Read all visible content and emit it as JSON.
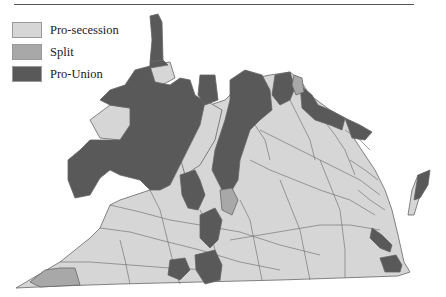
{
  "legend": {
    "items": [
      {
        "label": "Pro-secession",
        "color": "#d6d6d6"
      },
      {
        "label": "Split",
        "color": "#a8a8a8"
      },
      {
        "label": "Pro-Union",
        "color": "#595959"
      }
    ]
  },
  "map": {
    "subject": "Virginia counties secession vote",
    "colors": {
      "secession": "#d6d6d6",
      "split": "#a8a8a8",
      "union": "#595959",
      "border": "#666666"
    }
  }
}
